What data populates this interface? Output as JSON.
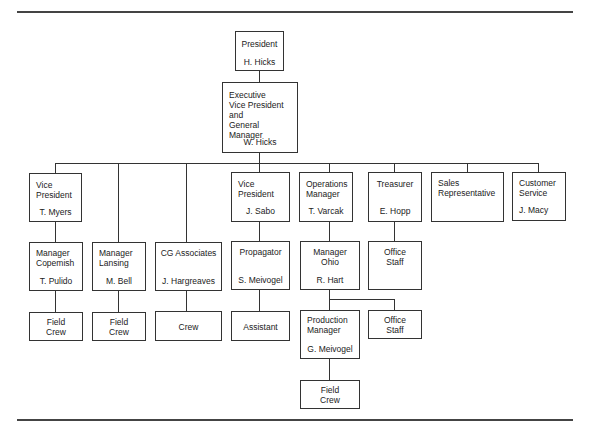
{
  "chart": {
    "type": "org-chart",
    "nodes": {
      "president": {
        "title": "President",
        "name": "H. Hicks"
      },
      "evp": {
        "title": "Executive\nVice President\nand\nGeneral Manager",
        "name": "W. Hicks"
      },
      "vp_myers": {
        "title": "Vice\nPresident",
        "name": "T. Myers"
      },
      "vp_sabo": {
        "title": "Vice\nPresident",
        "name": "J. Sabo"
      },
      "ops": {
        "title": "Operations\nManager",
        "name": "T. Varcak"
      },
      "treasurer": {
        "title": "Treasurer",
        "name": "E. Hopp"
      },
      "sales": {
        "title": "Sales\nRepresentative",
        "name": ""
      },
      "customer": {
        "title": "Customer\nService",
        "name": "J. Macy"
      },
      "copemish": {
        "title": "Manager\nCopemish",
        "name": "T. Pulido"
      },
      "lansing": {
        "title": "Manager\nLansing",
        "name": "M. Bell"
      },
      "cg": {
        "title": "CG Associates",
        "name": "J. Hargreaves"
      },
      "propagator": {
        "title": "Propagator",
        "name": "S. Meivogel"
      },
      "ohio": {
        "title": "Manager\nOhio",
        "name": "R. Hart"
      },
      "office1": {
        "title": "Office\nStaff"
      },
      "field1": {
        "title": "Field\nCrew"
      },
      "field2": {
        "title": "Field\nCrew"
      },
      "crew": {
        "title": "Crew"
      },
      "assistant": {
        "title": "Assistant"
      },
      "production": {
        "title": "Production\nManager",
        "name": "G. Meivogel"
      },
      "office2": {
        "title": "Office\nStaff"
      },
      "field3": {
        "title": "Field\nCrew"
      }
    }
  }
}
